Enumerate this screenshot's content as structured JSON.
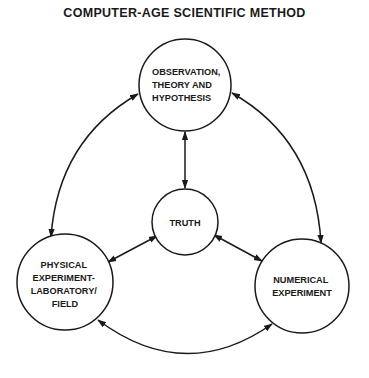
{
  "title": "COMPUTER-AGE SCIENTIFIC METHOD",
  "colors": {
    "stroke": "#1a1a1a",
    "background": "#ffffff"
  },
  "nodes": [
    {
      "id": "observation",
      "lines": [
        "OBSERVATION,",
        "THEORY AND",
        "HYPOTHESIS"
      ],
      "cx": 185,
      "cy": 85,
      "r": 46
    },
    {
      "id": "truth",
      "lines": [
        "TRUTH"
      ],
      "cx": 185,
      "cy": 222,
      "r": 33
    },
    {
      "id": "physical",
      "lines": [
        "PHYSICAL",
        "EXPERIMENT-",
        "LABORATORY/",
        "FIELD"
      ],
      "cx": 65,
      "cy": 282,
      "r": 48
    },
    {
      "id": "numerical",
      "lines": [
        "NUMERICAL",
        "EXPERIMENT"
      ],
      "cx": 302,
      "cy": 286,
      "r": 47
    }
  ],
  "edges": [
    {
      "from": "observation",
      "to": "truth",
      "type": "bidirectional"
    },
    {
      "from": "truth",
      "to": "physical",
      "type": "bidirectional"
    },
    {
      "from": "truth",
      "to": "numerical",
      "type": "bidirectional"
    },
    {
      "from": "observation",
      "to": "physical",
      "type": "bidirectional",
      "curved": true
    },
    {
      "from": "observation",
      "to": "numerical",
      "type": "bidirectional",
      "curved": true
    },
    {
      "from": "physical",
      "to": "numerical",
      "type": "bidirectional",
      "curved": true
    }
  ]
}
